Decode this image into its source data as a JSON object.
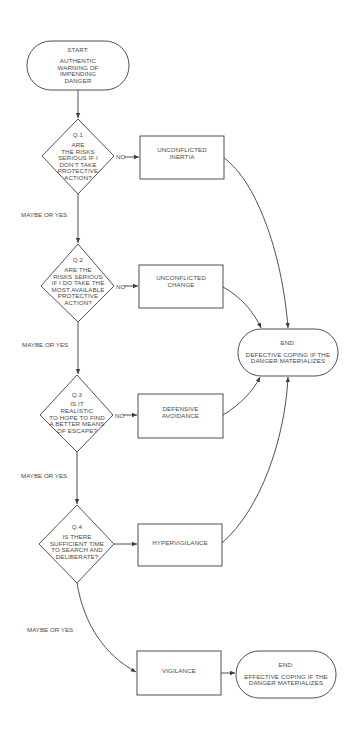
{
  "diagram": {
    "colors": {
      "background": "#ffffff",
      "stroke": "#3d3d3d",
      "text": "#4a4a4a"
    },
    "start": {
      "heading": "START:",
      "lines": [
        "AUTHENTIC",
        "WARNING OF",
        "IMPENDING",
        "DANGER"
      ]
    },
    "questions": [
      {
        "id": "Q.1",
        "label": "Q.1",
        "lines": [
          "ARE",
          "THE RISKS",
          "SERIOUS IF I",
          "DON'T TAKE",
          "PROTECTIVE",
          "ACTION?"
        ],
        "no_label": "NO"
      },
      {
        "id": "Q.2",
        "label": "Q.2",
        "lines": [
          "ARE THE",
          "RISKS SERIOUS",
          "IF I DO TAKE THE",
          "MOST AVAILABLE",
          "PROTECTIVE",
          "ACTION?"
        ],
        "no_label": "NO"
      },
      {
        "id": "Q.3",
        "label": "Q.3",
        "lines": [
          "IS IT",
          "REALISTIC",
          "TO HOPE TO FIND",
          "A BETTER MEANS",
          "OF ESCAPE?"
        ],
        "no_label": "NO"
      },
      {
        "id": "Q.4",
        "label": "Q.4",
        "lines": [
          "IS THERE",
          "SUFFICIENT TIME",
          "TO SEARCH AND",
          "DELIBERATE?"
        ],
        "no_label": ""
      }
    ],
    "outcomes": [
      {
        "lines": [
          "UNCONFLICTED",
          "INERTIA"
        ]
      },
      {
        "lines": [
          "UNCONFLICTED",
          "CHANGE"
        ]
      },
      {
        "lines": [
          "DEFENSIVE",
          "AVOIDANCE"
        ]
      },
      {
        "lines": [
          "HYPERVIGILANCE"
        ]
      },
      {
        "lines": [
          "VIGILANCE"
        ]
      }
    ],
    "yes_labels": [
      "MAYBE OR YES",
      "MAYBE OR YES",
      "MAYBE OR YES",
      "MAYBE OR YES"
    ],
    "end_defective": {
      "heading": "END:",
      "lines": [
        "DEFECTIVE COPING IF THE",
        "DANGER MATERIALIZES"
      ]
    },
    "end_effective": {
      "heading": "END:",
      "lines": [
        "EFFECTIVE COPING IF THE",
        "DANGER MATERIALIZES"
      ]
    }
  }
}
